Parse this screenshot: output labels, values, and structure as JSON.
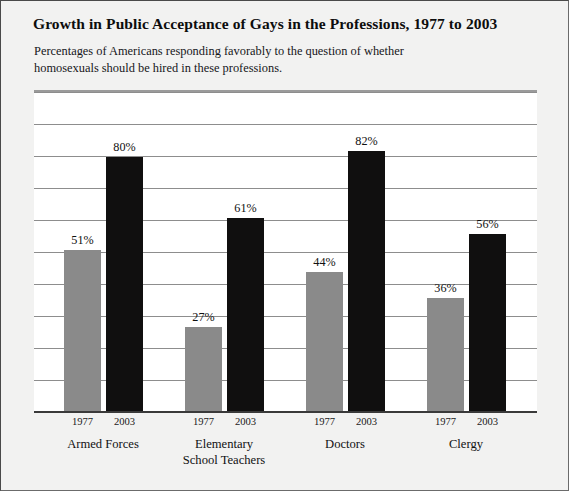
{
  "chart_data": {
    "type": "bar",
    "title": "Growth in Public Acceptance of Gays in the Professions, 1977 to 2003",
    "subtitle": "Percentages of Americans responding favorably to the question of whether homosexuals should be hired in these professions.",
    "categories": [
      "Armed Forces",
      "Elementary School Teachers",
      "Doctors",
      "Clergy"
    ],
    "series": [
      {
        "name": "1977",
        "values": [
          51,
          27,
          44,
          36
        ],
        "color": "#8a8a8a"
      },
      {
        "name": "2003",
        "values": [
          80,
          61,
          82,
          56
        ],
        "color": "#100f0f"
      }
    ],
    "value_labels": [
      [
        "51%",
        "80%"
      ],
      [
        "27%",
        "61%"
      ],
      [
        "44%",
        "82%"
      ],
      [
        "36%",
        "56%"
      ]
    ],
    "xlabel": "",
    "ylabel": "",
    "ylim": [
      0,
      100
    ],
    "gridlines": [
      10,
      20,
      30,
      40,
      50,
      60,
      70,
      80,
      90,
      100
    ],
    "grid": true,
    "legend": "none",
    "units": "percent"
  },
  "groups": [
    {
      "name_line1": "Armed Forces",
      "name_line2": "",
      "tick1": "1977",
      "tick2": "2003",
      "label1": "51%",
      "label2": "80%"
    },
    {
      "name_line1": "Elementary",
      "name_line2": "School Teachers",
      "tick1": "1977",
      "tick2": "2003",
      "label1": "27%",
      "label2": "61%"
    },
    {
      "name_line1": "Doctors",
      "name_line2": "",
      "tick1": "1977",
      "tick2": "2003",
      "label1": "44%",
      "label2": "82%"
    },
    {
      "name_line1": "Clergy",
      "name_line2": "",
      "tick1": "1977",
      "tick2": "2003",
      "label1": "36%",
      "label2": "56%"
    }
  ]
}
